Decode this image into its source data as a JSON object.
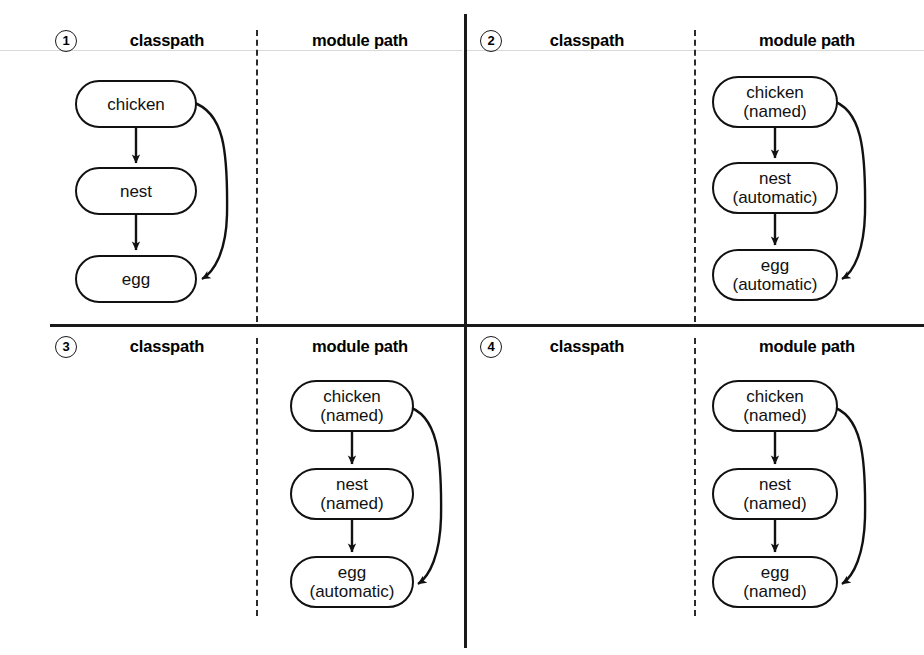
{
  "diagram": {
    "columns": {
      "left": "classpath",
      "right": "module path"
    },
    "colors": {
      "ink": "#111111",
      "divider": "#1a1a1a",
      "faint_rule": "#d9d9d9",
      "background": "#ffffff"
    },
    "edge_labels": {
      "chicken_to_nest": "",
      "nest_to_egg": "",
      "chicken_to_egg": ""
    }
  },
  "panels": [
    {
      "number": "1",
      "badge_name": "step-badge-1",
      "classpath_label": "classpath",
      "modulepath_label": "module path",
      "side": "classpath",
      "nodes": [
        {
          "id": "chicken",
          "name": "chicken",
          "kind": ""
        },
        {
          "id": "nest",
          "name": "nest",
          "kind": ""
        },
        {
          "id": "egg",
          "name": "egg",
          "kind": ""
        }
      ]
    },
    {
      "number": "2",
      "badge_name": "step-badge-2",
      "classpath_label": "classpath",
      "modulepath_label": "module path",
      "side": "modulepath",
      "nodes": [
        {
          "id": "chicken",
          "name": "chicken",
          "kind": "(named)"
        },
        {
          "id": "nest",
          "name": "nest",
          "kind": "(automatic)"
        },
        {
          "id": "egg",
          "name": "egg",
          "kind": "(automatic)"
        }
      ]
    },
    {
      "number": "3",
      "badge_name": "step-badge-3",
      "classpath_label": "classpath",
      "modulepath_label": "module path",
      "side": "modulepath",
      "nodes": [
        {
          "id": "chicken",
          "name": "chicken",
          "kind": "(named)"
        },
        {
          "id": "nest",
          "name": "nest",
          "kind": "(named)"
        },
        {
          "id": "egg",
          "name": "egg",
          "kind": "(automatic)"
        }
      ]
    },
    {
      "number": "4",
      "badge_name": "step-badge-4",
      "classpath_label": "classpath",
      "modulepath_label": "module path",
      "side": "modulepath",
      "nodes": [
        {
          "id": "chicken",
          "name": "chicken",
          "kind": "(named)"
        },
        {
          "id": "nest",
          "name": "nest",
          "kind": "(named)"
        },
        {
          "id": "egg",
          "name": "egg",
          "kind": "(named)"
        }
      ]
    }
  ]
}
